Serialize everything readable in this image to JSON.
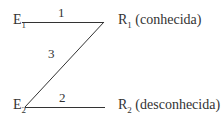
{
  "diagram": {
    "type": "electrical-bridge-schematic",
    "stroke_color": "#333333",
    "background_color": "#ffffff",
    "nodes": [
      {
        "id": "e1",
        "symbol": "E",
        "subscript": "1",
        "position": "top-left"
      },
      {
        "id": "e2",
        "symbol": "E",
        "subscript": "2",
        "position": "bottom-left"
      },
      {
        "id": "r1",
        "symbol": "R",
        "subscript": "1",
        "annotation": "(conhecida)",
        "position": "top-right"
      },
      {
        "id": "r2",
        "symbol": "R",
        "subscript": "2",
        "annotation": "(desconhecida)",
        "position": "bottom-right"
      }
    ],
    "edges": [
      {
        "id": "edge-1",
        "label": "1",
        "from": "e1",
        "to": "r1",
        "orientation": "horizontal",
        "x1": 22,
        "y1": 22,
        "x2": 104,
        "y2": 22
      },
      {
        "id": "edge-2",
        "label": "2",
        "from": "e2",
        "to": "r2",
        "orientation": "horizontal",
        "x1": 25,
        "y1": 107,
        "x2": 105,
        "y2": 107
      },
      {
        "id": "edge-3",
        "label": "3",
        "from": "e2",
        "to": "r1",
        "orientation": "diagonal",
        "x1": 25,
        "y1": 107,
        "x2": 104,
        "y2": 22
      }
    ]
  }
}
